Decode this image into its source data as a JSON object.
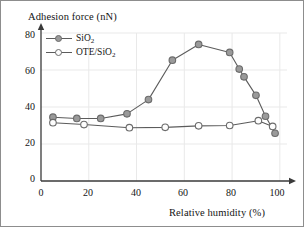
{
  "figure": {
    "y_axis_title": "Adhesion force (nN)",
    "x_axis_title": "Relative humidity (%)",
    "y_ticks": [
      "80",
      "60",
      "40",
      "20",
      "0"
    ],
    "x_ticks": [
      "0",
      "20",
      "40",
      "60",
      "80",
      "100"
    ],
    "legend": [
      {
        "label_main": "SiO",
        "label_sub": "2",
        "marker": "filled-circle-marker",
        "name": "legend-item-sio2"
      },
      {
        "label_main": "OTE/SiO",
        "label_sub": "2",
        "marker": "hollow-circle-marker",
        "name": "legend-item-ote-sio2"
      }
    ],
    "colors": {
      "series_line": "#5c5c5c",
      "marker_fill_sio2": "#9a9a9a",
      "marker_fill_ote": "#fdfdfd",
      "marker_stroke": "#6b6b6b",
      "axis": "#3a3a3a",
      "grid": "#e9e9e9",
      "frame": "#8d8d8d",
      "background": "#ffffff"
    }
  },
  "chart_data": {
    "type": "line",
    "title": "",
    "xlabel": "Relative humidity (%)",
    "ylabel": "Adhesion force (nN)",
    "xlim": [
      0,
      103
    ],
    "ylim": [
      0,
      80
    ],
    "xticks": [
      0,
      20,
      40,
      60,
      80,
      100
    ],
    "yticks": [
      0,
      20,
      40,
      60,
      80
    ],
    "grid": true,
    "legend_position": "upper-left",
    "series": [
      {
        "name": "SiO2",
        "marker": "filled-circle",
        "x": [
          5,
          15,
          25,
          36,
          45,
          55,
          66,
          79,
          83,
          85,
          90,
          94,
          98
        ],
        "y": [
          34.5,
          33.8,
          33.8,
          36.3,
          44.0,
          65.3,
          73.8,
          69.5,
          60.5,
          56.3,
          46.3,
          35.0,
          25.8
        ]
      },
      {
        "name": "OTE/SiO2",
        "marker": "hollow-circle",
        "x": [
          5,
          18,
          37,
          52,
          66,
          79,
          91,
          97
        ],
        "y": [
          31.5,
          30.5,
          28.8,
          29.0,
          29.8,
          30.0,
          32.6,
          29.5
        ]
      }
    ]
  }
}
